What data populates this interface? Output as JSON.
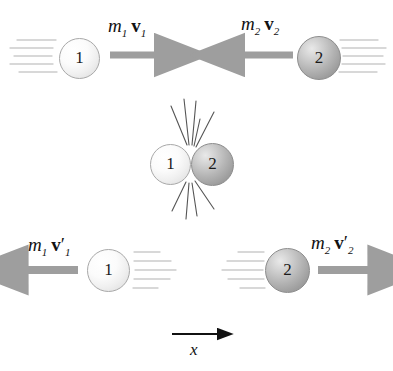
{
  "figure": {
    "background_color": "#ffffff",
    "width": 393,
    "height": 371
  },
  "colors": {
    "ball_light_fill": "#f2f2f2",
    "ball_dark_fill": "#b0b0b0",
    "ball_outline": "#9a9a9a",
    "arrow_gray": "#9e9e9e",
    "axis_black": "#111111",
    "impact_line": "#4a4a4a",
    "speed_line": "#c8c8c8",
    "text": "#111111"
  },
  "rows": {
    "before": {
      "name": "before-collision",
      "ball_left": {
        "label": "1",
        "shade": "light",
        "direction": "right"
      },
      "ball_right": {
        "label": "2",
        "shade": "dark",
        "direction": "left"
      },
      "momentum_left": {
        "mass": "m",
        "mass_sub": "1",
        "vector": "v",
        "vector_sub": "1",
        "prime": ""
      },
      "momentum_right": {
        "mass": "m",
        "mass_sub": "2",
        "vector": "v",
        "vector_sub": "2",
        "prime": ""
      }
    },
    "collision": {
      "name": "collision-instant",
      "ball_left": {
        "label": "1",
        "shade": "light"
      },
      "ball_right": {
        "label": "2",
        "shade": "dark"
      },
      "impact_lines_above": 5,
      "impact_lines_below": 4
    },
    "after": {
      "name": "after-collision",
      "ball_left": {
        "label": "1",
        "shade": "light",
        "direction": "left"
      },
      "ball_right": {
        "label": "2",
        "shade": "dark",
        "direction": "right"
      },
      "momentum_left": {
        "mass": "m",
        "mass_sub": "1",
        "vector": "v",
        "vector_sub": "1",
        "prime": "′"
      },
      "momentum_right": {
        "mass": "m",
        "mass_sub": "2",
        "vector": "v",
        "vector_sub": "2",
        "prime": "′"
      }
    }
  },
  "axis": {
    "name": "x-axis",
    "label": "x",
    "direction": "right"
  }
}
